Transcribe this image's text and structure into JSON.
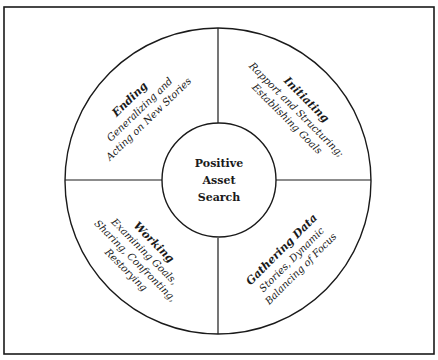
{
  "diagram": {
    "type": "circular-stage-diagram",
    "colors": {
      "stroke": "#1a1a1a",
      "background": "#ffffff"
    },
    "center": {
      "lines": [
        "Positive",
        "Asset",
        "Search"
      ]
    },
    "quadrants": [
      {
        "id": "ending",
        "position": "top-left",
        "title": "Ending",
        "lines": [
          "Generalizing and",
          "Acting on New Stories"
        ]
      },
      {
        "id": "initiating",
        "position": "top-right",
        "title": "Initiating",
        "lines": [
          "Rapport and Structuring;",
          "Establishing Goals"
        ]
      },
      {
        "id": "working",
        "position": "bottom-left",
        "title": "Working",
        "lines": [
          "Examining Goals,",
          "Sharing, Confronting,",
          "Restorying"
        ]
      },
      {
        "id": "gathering-data",
        "position": "bottom-right",
        "title": "Gathering Data",
        "lines": [
          "Stories, Dynamic",
          "Balancing of Focus"
        ]
      }
    ]
  }
}
